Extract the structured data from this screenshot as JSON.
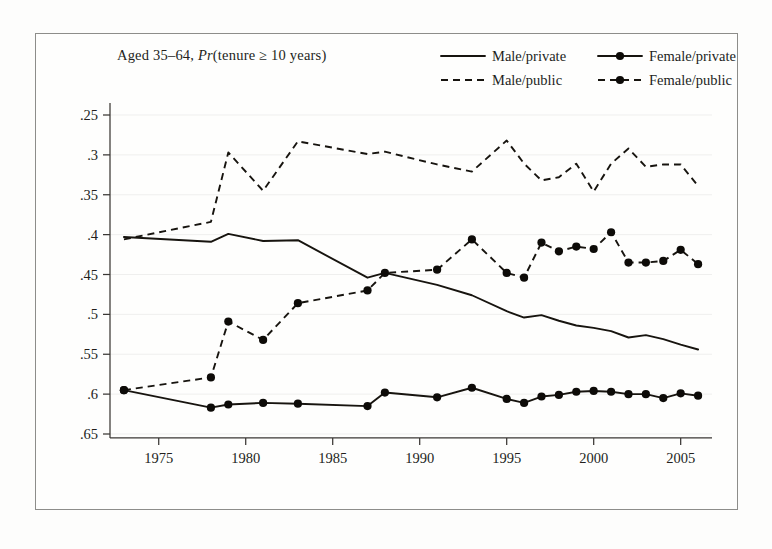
{
  "subtitle": {
    "prefix": "Aged 35–64, ",
    "italic": "Pr",
    "suffix": "(tenure ≥ 10 years)"
  },
  "legend": {
    "position": "top-right",
    "entries": [
      {
        "label": "Male/private",
        "style": "solid",
        "marker": false
      },
      {
        "label": "Female/private",
        "style": "solid",
        "marker": true
      },
      {
        "label": "Male/public",
        "style": "dashed",
        "marker": false
      },
      {
        "label": "Female/public",
        "style": "dashed",
        "marker": true
      }
    ]
  },
  "axes": {
    "y_ticks": [
      ".65",
      ".6",
      ".55",
      ".5",
      ".45",
      ".4",
      ".35",
      ".3",
      ".25"
    ],
    "x_ticks": [
      "1975",
      "1980",
      "1985",
      "1990",
      "1995",
      "2000",
      "2005"
    ],
    "xlabel": "",
    "ylabel": ""
  },
  "colors": {
    "ink": "#17140f",
    "axis": "#3a3734",
    "grid": "#efefee",
    "frame": "#8d8d8a",
    "page": "#fdfdfc"
  },
  "chart_data": {
    "type": "line",
    "title": "",
    "subtitle": "Aged 35–64, Pr(tenure ≥ 10 years)",
    "xlabel": "",
    "ylabel": "",
    "xlim": [
      1972.2,
      2006.8
    ],
    "ylim": [
      0.25,
      0.665
    ],
    "x_ticks": [
      1975,
      1980,
      1985,
      1990,
      1995,
      2000,
      2005
    ],
    "y_ticks": [
      0.25,
      0.3,
      0.35,
      0.4,
      0.45,
      0.5,
      0.55,
      0.6,
      0.65
    ],
    "grid": "horizontal-faint",
    "legend_position": "top-right",
    "series": [
      {
        "name": "Male/private",
        "style": "solid",
        "markers": false,
        "x": [
          1973,
          1978,
          1979,
          1981,
          1983,
          1987,
          1988,
          1991,
          1993,
          1995,
          1996,
          1997,
          1998,
          1999,
          2000,
          2001,
          2002,
          2003,
          2004,
          2005,
          2006
        ],
        "y": [
          0.497,
          0.491,
          0.501,
          0.492,
          0.493,
          0.446,
          0.452,
          0.437,
          0.424,
          0.404,
          0.396,
          0.399,
          0.392,
          0.386,
          0.383,
          0.379,
          0.371,
          0.374,
          0.369,
          0.362,
          0.356
        ]
      },
      {
        "name": "Male/public",
        "style": "dashed",
        "markers": false,
        "x": [
          1973,
          1978,
          1979,
          1981,
          1983,
          1987,
          1988,
          1991,
          1993,
          1995,
          1996,
          1997,
          1998,
          1999,
          2000,
          2001,
          2002,
          2003,
          2004,
          2005,
          2006
        ],
        "y": [
          0.494,
          0.516,
          0.603,
          0.555,
          0.617,
          0.601,
          0.604,
          0.588,
          0.579,
          0.618,
          0.589,
          0.568,
          0.572,
          0.589,
          0.554,
          0.589,
          0.608,
          0.585,
          0.588,
          0.588,
          0.561
        ]
      },
      {
        "name": "Female/private",
        "style": "solid",
        "markers": true,
        "x": [
          1973,
          1978,
          1979,
          1981,
          1983,
          1987,
          1988,
          1991,
          1993,
          1995,
          1996,
          1997,
          1998,
          1999,
          2000,
          2001,
          2002,
          2003,
          2004,
          2005,
          2006
        ],
        "y": [
          0.305,
          0.283,
          0.287,
          0.289,
          0.288,
          0.285,
          0.302,
          0.296,
          0.308,
          0.294,
          0.289,
          0.297,
          0.299,
          0.303,
          0.304,
          0.303,
          0.3,
          0.3,
          0.295,
          0.301,
          0.298
        ]
      },
      {
        "name": "Female/public",
        "style": "dashed",
        "markers": true,
        "x": [
          1973,
          1978,
          1979,
          1981,
          1983,
          1987,
          1988,
          1991,
          1993,
          1995,
          1996,
          1997,
          1998,
          1999,
          2000,
          2001,
          2002,
          2003,
          2004,
          2005,
          2006
        ],
        "y": [
          0.305,
          0.321,
          0.391,
          0.368,
          0.414,
          0.43,
          0.452,
          0.456,
          0.494,
          0.452,
          0.446,
          0.49,
          0.479,
          0.485,
          0.482,
          0.503,
          0.465,
          0.465,
          0.467,
          0.481,
          0.463
        ]
      }
    ]
  }
}
